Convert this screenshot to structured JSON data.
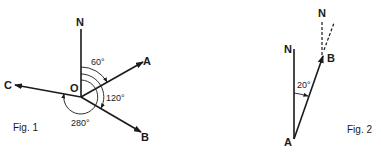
{
  "figures": [
    {
      "caption": "Fig. 1",
      "origin_label": "O",
      "north_label": "N",
      "vectors": [
        {
          "label": "A",
          "bearing_deg": 60
        },
        {
          "label": "B",
          "bearing_deg": 120
        },
        {
          "label": "C",
          "bearing_deg": 280
        }
      ],
      "angle_labels": [
        "60°",
        "120°",
        "280°"
      ]
    },
    {
      "caption": "Fig. 2",
      "north_label_a": "N",
      "north_label_b": "N",
      "point_a": "A",
      "point_b": "B",
      "angle_label": "20°"
    }
  ],
  "colors": {
    "ink": "#1a1a1a",
    "background": "#ffffff"
  }
}
